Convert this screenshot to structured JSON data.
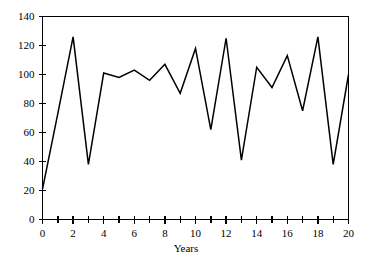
{
  "chart_data": {
    "type": "line",
    "title": "",
    "subtitle": "",
    "xlabel": "Years",
    "ylabel": "",
    "xlim": [
      0,
      20
    ],
    "ylim": [
      0,
      140
    ],
    "grid": false,
    "legend": null,
    "x_ticks_major": [
      0,
      2,
      4,
      6,
      8,
      10,
      12,
      14,
      16,
      18,
      20
    ],
    "x_ticks_minor": [
      1,
      3,
      5,
      7,
      9,
      11,
      13,
      15,
      17,
      19
    ],
    "y_ticks": [
      0,
      20,
      40,
      60,
      80,
      100,
      120,
      140
    ],
    "x_tick_labels": [
      "0",
      "2",
      "4",
      "6",
      "8",
      "10",
      "12",
      "14",
      "16",
      "18",
      "20"
    ],
    "y_tick_labels": [
      "0",
      "20",
      "40",
      "60",
      "80",
      "100",
      "120",
      "140"
    ],
    "series": [
      {
        "name": "series-1",
        "color": "#000000",
        "x": [
          0,
          1,
          2,
          3,
          4,
          5,
          6,
          7,
          8,
          9,
          10,
          11,
          12,
          13,
          14,
          15,
          16,
          17,
          18,
          19,
          20
        ],
        "values": [
          21,
          73,
          126,
          38,
          101,
          98,
          103,
          96,
          107,
          87,
          118,
          62,
          125,
          41,
          105,
          91,
          113,
          75,
          126,
          38,
          100
        ]
      }
    ]
  },
  "axis": {
    "x_title": "Years"
  }
}
